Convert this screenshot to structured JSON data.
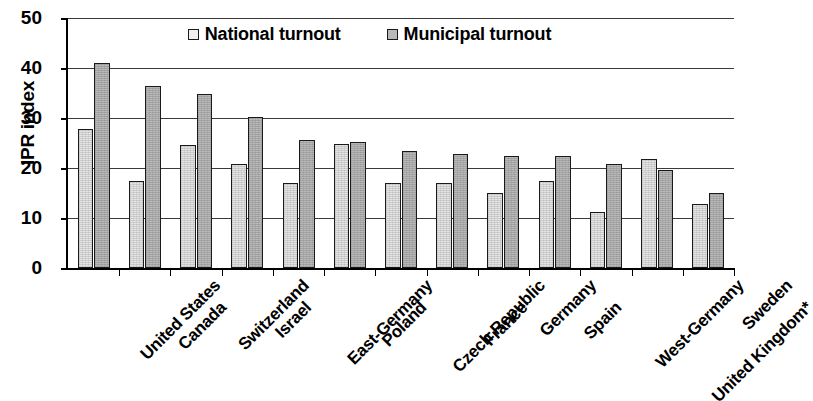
{
  "chart_data": {
    "type": "bar",
    "title": "",
    "xlabel": "",
    "ylabel": "IPR index",
    "ylim": [
      0,
      50
    ],
    "yticks": [
      0,
      10,
      20,
      30,
      40,
      50
    ],
    "grid": true,
    "legend_position": "top-center",
    "categories": [
      "United States",
      "Canada",
      "Switzerland",
      "Israel",
      "East-Germany",
      "Poland",
      "Czech Republic",
      "France",
      "Germany",
      "Spain",
      "West-Germany",
      "United Kingdom*",
      "Sweden"
    ],
    "series": [
      {
        "name": "National turnout",
        "color": "#e4e4e4",
        "values": [
          27.9,
          17.4,
          24.7,
          20.8,
          17.0,
          24.8,
          17.0,
          17.0,
          15.0,
          17.5,
          11.3,
          21.8,
          12.8
        ]
      },
      {
        "name": "Municipal turnout",
        "color": "#b9b9b9",
        "values": [
          41.1,
          36.4,
          34.8,
          30.2,
          25.6,
          25.2,
          23.5,
          22.9,
          22.4,
          22.4,
          20.8,
          19.7,
          15.0
        ]
      }
    ]
  },
  "legend": {
    "entries": [
      {
        "label": "National turnout",
        "swatch": "national"
      },
      {
        "label": "Municipal turnout",
        "swatch": "municipal"
      }
    ]
  },
  "axis": {
    "y_title": "IPR index",
    "y_tick_labels": [
      "50",
      "40",
      "30",
      "20",
      "10",
      "0"
    ]
  }
}
